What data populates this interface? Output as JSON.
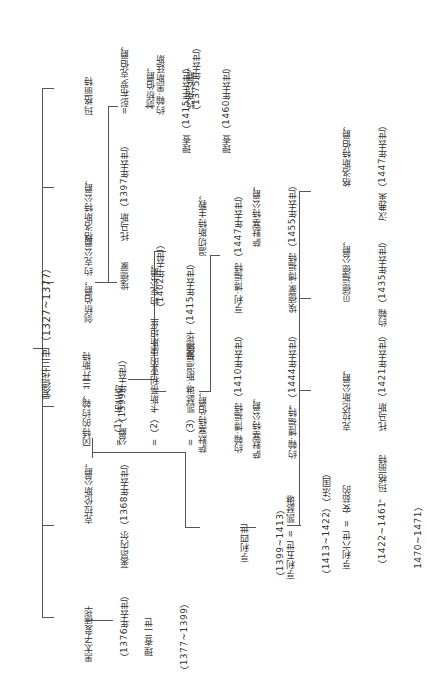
{
  "root": {
    "name": "爱德华三世（1327~1377）"
  },
  "children": [
    {
      "id": "margaret",
      "lines": [
        "玛格丽特",
        "=彭布罗克伯爵，",
        "约翰·黑斯廷斯",
        "（1375年去世）"
      ]
    },
    {
      "id": "gloucester",
      "lines": [
        "格洛斯特公爵，",
        "托马斯（1397年去世）"
      ]
    },
    {
      "id": "cambridge_york",
      "lines": [
        "剑桥伯爵，约克公爵，",
        "埃德蒙",
        "（1402年去世）"
      ]
    },
    {
      "id": "gaunt",
      "lines": [
        "冈特的约翰，兰开斯特",
        "公爵（1399年去世）"
      ]
    },
    {
      "id": "clarence",
      "lines": [
        "克拉伦斯公爵，",
        "莱昂内尔（1368年去世）"
      ]
    },
    {
      "id": "black_prince",
      "lines": [
        "黑太子爱德华",
        "（1376年去世）"
      ]
    }
  ],
  "york_line": {
    "edward": [
      "约克公爵，",
      "爱德华（1415年去世）"
    ],
    "richard_cambridge": [
      "剑桥伯爵，",
      "理查（1415年去世）"
    ],
    "richard_york": [
      "约克公爵，",
      "理查（1460年去世）"
    ]
  },
  "gaunt_wives": [
    "=（1）布兰奇",
    "=（2）卡斯蒂利亚的康斯坦丝",
    "=（3）凯瑟琳·斯温福德"
  ],
  "beaufort": {
    "john_somerset_earl": [
      "萨默塞特伯爵，",
      "约翰·博福特（1410年去世）"
    ],
    "henry_winchester": [
      "温切斯特主教，",
      "亨利·博福特（1447年去世）"
    ],
    "john_somerset_duke": [
      "萨默塞特公爵，",
      "约翰·博福特，（1444年去世）"
    ],
    "edmund_somerset_duke": [
      "萨默塞特公爵，",
      "埃德蒙·博福特（1455年去世）"
    ]
  },
  "lancaster_kings": {
    "henry4": [
      "亨利四世",
      "（1399~1413）"
    ],
    "henry5": [
      "亨利五世 =  凯瑟琳",
      "（1413~1422）（法国）"
    ],
    "henry6": [
      "亨利六世 =  安茹的",
      "（1422~1461，玛格丽特",
      "1470~1471）"
    ]
  },
  "henry4_sons": {
    "clarence": [
      "克拉伦斯公爵，",
      "托马斯（1421年去世）"
    ],
    "bedford": [
      "贝德福德公爵，",
      "约翰（1435年去世）"
    ],
    "gloucester": [
      "格洛斯特伯爵，",
      "汉弗莱（1447年去世）"
    ]
  },
  "richard2": [
    "理查二世",
    "（1377~1399）"
  ]
}
